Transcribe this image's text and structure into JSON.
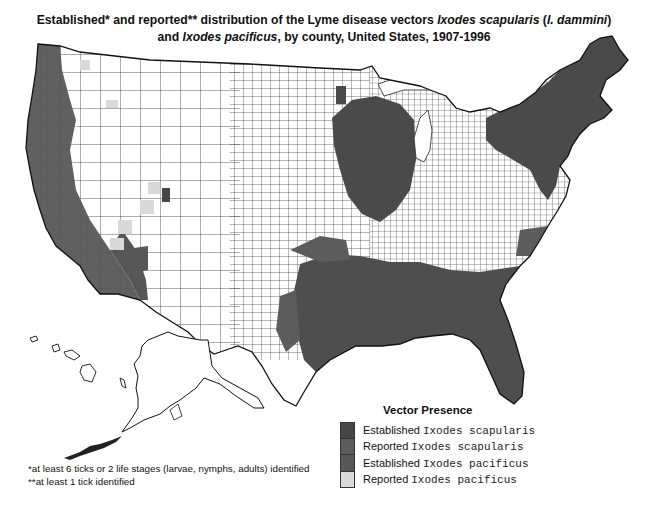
{
  "title": {
    "line1_prefix": "Established* and reported** distribution of the Lyme disease vectors ",
    "line1_species": "Ixodes scapularis",
    "line1_open": " (",
    "line1_synonym": "I. dammini",
    "line1_close": ")",
    "line2_prefix": "and ",
    "line2_species": "Ixodes pacificus",
    "line2_suffix": ", by county, United States, 1907-1996"
  },
  "legend": {
    "title": "Vector Presence",
    "items": [
      {
        "status": "Established",
        "species": "Ixodes scapularis",
        "color": "#464646"
      },
      {
        "status": "Reported",
        "species": "Ixodes scapularis",
        "color": "#5c5c5c"
      },
      {
        "status": "Established",
        "species": "Ixodes pacificus",
        "color": "#575757"
      },
      {
        "status": "Reported",
        "species": "Ixodes pacificus",
        "color": "#d9d9d9"
      }
    ]
  },
  "footnotes": [
    "*at least 6 ticks or 2 life stages (larvae, nymphs, adults) identified",
    "**at least 1 tick identified"
  ],
  "map": {
    "regions": [
      "Contiguous United States",
      "Alaska",
      "Hawaii"
    ],
    "unit": "county",
    "colors": {
      "no_data": "#ffffff",
      "border": "#222222"
    }
  }
}
